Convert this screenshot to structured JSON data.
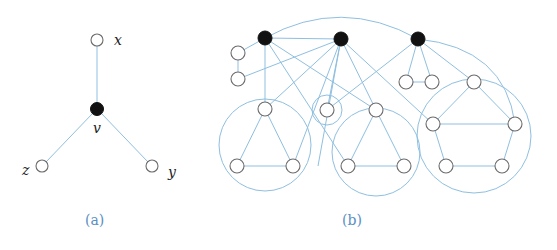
{
  "figure": {
    "colors": {
      "edge": "#8fbfe0",
      "black_node": "#111111",
      "white_node_stroke": "#6b6b6b",
      "caption": "#5b8fc4"
    },
    "panel_a": {
      "caption": "(a)",
      "labels": {
        "x": "x",
        "v": "v",
        "z": "z",
        "y": "y"
      },
      "nodes": [
        {
          "id": "x",
          "type": "white",
          "cx": 97,
          "cy": 40
        },
        {
          "id": "v",
          "type": "black",
          "cx": 97,
          "cy": 109
        },
        {
          "id": "z",
          "type": "white",
          "cx": 42,
          "cy": 166
        },
        {
          "id": "y",
          "type": "white",
          "cx": 152,
          "cy": 166
        }
      ],
      "edges": [
        [
          "x",
          "v"
        ],
        [
          "v",
          "z"
        ],
        [
          "v",
          "y"
        ]
      ]
    },
    "panel_b": {
      "caption": "(b)",
      "black_nodes": [
        {
          "id": "b1",
          "cx": 265,
          "cy": 38
        },
        {
          "id": "b2",
          "cx": 341,
          "cy": 39
        },
        {
          "id": "b3",
          "cx": 418,
          "cy": 39
        }
      ],
      "white_nodes": [
        {
          "id": "l1",
          "cx": 238,
          "cy": 53
        },
        {
          "id": "l2",
          "cx": 238,
          "cy": 79
        },
        {
          "id": "t1a",
          "cx": 265,
          "cy": 109
        },
        {
          "id": "t1b",
          "cx": 237,
          "cy": 166
        },
        {
          "id": "t1c",
          "cx": 293,
          "cy": 166
        },
        {
          "id": "s",
          "cx": 327,
          "cy": 110
        },
        {
          "id": "t2a",
          "cx": 376,
          "cy": 110
        },
        {
          "id": "t2b",
          "cx": 348,
          "cy": 166
        },
        {
          "id": "t2c",
          "cx": 404,
          "cy": 166
        },
        {
          "id": "r1",
          "cx": 406,
          "cy": 82
        },
        {
          "id": "r2",
          "cx": 432,
          "cy": 82
        },
        {
          "id": "p1",
          "cx": 474,
          "cy": 82
        },
        {
          "id": "p2",
          "cx": 433,
          "cy": 124
        },
        {
          "id": "p3",
          "cx": 515,
          "cy": 124
        },
        {
          "id": "p4",
          "cx": 446,
          "cy": 166
        },
        {
          "id": "p5",
          "cx": 502,
          "cy": 166
        }
      ],
      "group_circles": [
        {
          "id": "g-left-triangle",
          "cx": 265,
          "cy": 145,
          "r": 46
        },
        {
          "id": "g-small",
          "cx": 327,
          "cy": 110,
          "r": 15
        },
        {
          "id": "g-mid-triangle",
          "cx": 376,
          "cy": 152,
          "r": 44
        },
        {
          "id": "g-pentagon",
          "cx": 474,
          "cy": 136,
          "r": 57
        }
      ]
    }
  }
}
